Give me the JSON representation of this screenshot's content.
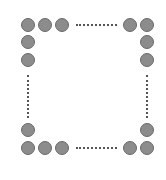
{
  "diagram": {
    "circle_color": "#8c8c8c",
    "circle_border": "#6a6a6a",
    "circle_diameter": 14,
    "circles": [
      {
        "id": "top-1",
        "cx": 28,
        "cy": 25
      },
      {
        "id": "top-2",
        "cx": 45,
        "cy": 25
      },
      {
        "id": "top-3",
        "cx": 62,
        "cy": 25
      },
      {
        "id": "top-4",
        "cx": 130,
        "cy": 25
      },
      {
        "id": "top-5",
        "cx": 147,
        "cy": 25
      },
      {
        "id": "left-2",
        "cx": 28,
        "cy": 42
      },
      {
        "id": "left-3",
        "cx": 28,
        "cy": 60
      },
      {
        "id": "left-4",
        "cx": 28,
        "cy": 130
      },
      {
        "id": "right-2",
        "cx": 147,
        "cy": 42
      },
      {
        "id": "right-3",
        "cx": 147,
        "cy": 60
      },
      {
        "id": "right-4",
        "cx": 147,
        "cy": 130
      },
      {
        "id": "bottom-1",
        "cx": 28,
        "cy": 148
      },
      {
        "id": "bottom-2",
        "cx": 45,
        "cy": 148
      },
      {
        "id": "bottom-3",
        "cx": 62,
        "cy": 148
      },
      {
        "id": "bottom-4",
        "cx": 130,
        "cy": 148
      },
      {
        "id": "bottom-5",
        "cx": 147,
        "cy": 148
      }
    ],
    "ellipses": [
      {
        "id": "top-dots",
        "orientation": "horizontal",
        "x1": 76,
        "x2": 117,
        "y": 24
      },
      {
        "id": "bottom-dots",
        "orientation": "horizontal",
        "x1": 76,
        "x2": 117,
        "y": 147
      },
      {
        "id": "left-dots",
        "orientation": "vertical",
        "x": 27,
        "y1": 75,
        "y2": 118
      },
      {
        "id": "right-dots",
        "orientation": "vertical",
        "x": 146,
        "y1": 75,
        "y2": 118
      }
    ]
  }
}
